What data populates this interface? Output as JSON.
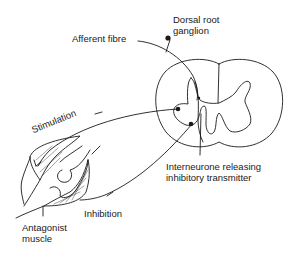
{
  "diagram": {
    "type": "neural-pathway",
    "labels": {
      "dorsal_root_ganglion": "Dorsal root\nganglion",
      "afferent_fibre": "Afferent fibre",
      "stimulation": "Stimulation",
      "interneurone": "Interneurone releasing\ninhibitory transmitter",
      "inhibition": "Inhibition",
      "antagonist_muscle": "Antagonist\nmuscle"
    },
    "nodes": [
      {
        "id": "ganglion",
        "label": "Dorsal root ganglion"
      },
      {
        "id": "spinal-cord",
        "label": "Spinal cord cross-section"
      },
      {
        "id": "motor-neuron-stim",
        "label": "Motor neurone (stimulation)"
      },
      {
        "id": "interneurone",
        "label": "Interneurone releasing inhibitory transmitter"
      },
      {
        "id": "motor-neuron-inhib",
        "label": "Motor neurone (inhibition)"
      },
      {
        "id": "muscle",
        "label": "Antagonist muscle"
      }
    ],
    "edges": [
      {
        "from": "muscle",
        "to": "ganglion",
        "label": "Afferent fibre"
      },
      {
        "from": "ganglion",
        "to": "spinal-cord",
        "label": ""
      },
      {
        "from": "motor-neuron-stim",
        "to": "muscle",
        "label": "Stimulation"
      },
      {
        "from": "interneurone",
        "to": "motor-neuron-inhib",
        "label": ""
      },
      {
        "from": "motor-neuron-inhib",
        "to": "muscle",
        "label": "Inhibition"
      }
    ],
    "colors": {
      "stroke": "#1a1a1a",
      "background": "#ffffff"
    }
  }
}
